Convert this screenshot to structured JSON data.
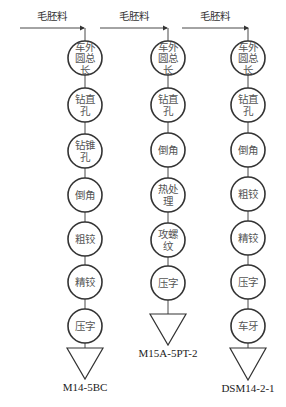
{
  "diagram": {
    "input_label": "毛胚料",
    "colors": {
      "stroke": "#333333",
      "text": "#555555",
      "background": "#ffffff"
    },
    "columns": [
      {
        "id": "col1",
        "cx": 85,
        "arrow": {
          "x1": 20,
          "x2": 84,
          "y": 28
        },
        "label_x": 52,
        "nodes": [
          {
            "cy": 58,
            "lines": [
              "车外",
              "圆总",
              "长"
            ]
          },
          {
            "cy": 105,
            "lines": [
              "钻直",
              "孔"
            ]
          },
          {
            "cy": 151,
            "lines": [
              "钻锥",
              "孔"
            ]
          },
          {
            "cy": 195,
            "lines": [
              "倒角"
            ]
          },
          {
            "cy": 239,
            "lines": [
              "粗铰"
            ]
          },
          {
            "cy": 282,
            "lines": [
              "精铰"
            ]
          },
          {
            "cy": 326,
            "lines": [
              "压字"
            ]
          }
        ],
        "triangle": {
          "top": 348,
          "apex": 379,
          "half": 18
        },
        "product": "M14-5BC",
        "product_y": 391
      },
      {
        "id": "col2",
        "cx": 168,
        "arrow": {
          "x1": 100,
          "x2": 167,
          "y": 28
        },
        "label_x": 134,
        "nodes": [
          {
            "cy": 58,
            "lines": [
              "车外",
              "圆总",
              "长"
            ]
          },
          {
            "cy": 105,
            "lines": [
              "钻直",
              "孔"
            ]
          },
          {
            "cy": 150,
            "lines": [
              "倒角"
            ]
          },
          {
            "cy": 195,
            "lines": [
              "热处",
              "理"
            ]
          },
          {
            "cy": 240,
            "lines": [
              "攻螺",
              "纹"
            ]
          },
          {
            "cy": 283,
            "lines": [
              "压字"
            ]
          }
        ],
        "triangle": {
          "top": 314,
          "apex": 345,
          "half": 18
        },
        "product": "M15A-5PT-2",
        "product_y": 357
      },
      {
        "id": "col3",
        "cx": 248,
        "arrow": {
          "x1": 182,
          "x2": 248,
          "y": 28
        },
        "label_x": 215,
        "nodes": [
          {
            "cy": 58,
            "lines": [
              "车外",
              "圆总",
              "长"
            ]
          },
          {
            "cy": 105,
            "lines": [
              "钻直",
              "孔"
            ]
          },
          {
            "cy": 150,
            "lines": [
              "倒角"
            ]
          },
          {
            "cy": 194,
            "lines": [
              "粗铰"
            ]
          },
          {
            "cy": 238,
            "lines": [
              "精铰"
            ]
          },
          {
            "cy": 282,
            "lines": [
              "压字"
            ]
          },
          {
            "cy": 326,
            "lines": [
              "车牙"
            ]
          }
        ],
        "triangle": {
          "top": 348,
          "apex": 380,
          "half": 18
        },
        "product": "DSM14-2-1",
        "product_y": 392
      }
    ]
  }
}
